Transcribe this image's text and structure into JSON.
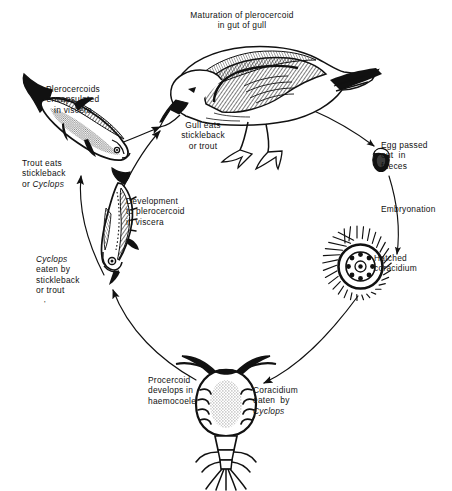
{
  "figure": {
    "kind": "life-cycle-diagram",
    "background_color": "#ffffff",
    "ink_color": "#111111"
  },
  "labels": {
    "title_line1": "Maturation of plerocercoid",
    "title_line2": "in gut of gull",
    "gull_eats_line1": "Gull eats",
    "gull_eats_line2": "stickleback",
    "gull_eats_line3": "or trout",
    "egg_line1": "Egg passed",
    "egg_line2": "out  in",
    "egg_line3": "faeces",
    "embryonation": "Embryonation",
    "hatched_line1": "Hatched",
    "hatched_line2": "coracidium",
    "coracidium_eaten_line1": "Coracidium",
    "coracidium_eaten_line2": "eaten  by",
    "coracidium_eaten_line3": "Cyclops",
    "procercoid_line1": "Procercoid",
    "procercoid_line2": "develops in",
    "procercoid_line3": "haemocoele",
    "cyclops_eaten_line1": "Cyclops",
    "cyclops_eaten_line2": "eaten by",
    "cyclops_eaten_line3": "stickleback",
    "cyclops_eaten_line4": "or trout",
    "development_line1": "Development",
    "development_line2": "to plerocercoid",
    "development_line3": "in viscera",
    "trout_eats_line1": "Trout eats",
    "trout_eats_line2": "stickleback",
    "trout_eats_line3": "or Cyclops",
    "trout_eats_line3_plain": "or ",
    "trout_eats_line3_italic": "Cyclops",
    "plerocercoids_line1": "Plerocercoids",
    "plerocercoids_line2": "encapsulated",
    "plerocercoids_line3": "in viscera",
    "stray_mark": "'"
  },
  "organisms": [
    {
      "name": "gull",
      "label": "Herring gull (definitive host)",
      "position": "top"
    },
    {
      "name": "egg",
      "label": "Tapeworm egg with operculum",
      "position": "right-upper"
    },
    {
      "name": "coracidium",
      "label": "Ciliated coracidium larva",
      "position": "right-lower"
    },
    {
      "name": "cyclops",
      "label": "Cyclops copepod (first intermediate host)",
      "position": "bottom"
    },
    {
      "name": "stickleback",
      "label": "Stickleback (second intermediate host)",
      "position": "left-lower"
    },
    {
      "name": "trout",
      "label": "Trout (paratenic host)",
      "position": "left-upper"
    }
  ],
  "stages": [
    {
      "from": "gull",
      "to": "egg",
      "label": "Egg passed out in faeces"
    },
    {
      "from": "egg",
      "to": "coracidium",
      "label": "Embryonation"
    },
    {
      "from": "coracidium",
      "to": "cyclops",
      "label": "Coracidium eaten by Cyclops"
    },
    {
      "from": "cyclops",
      "to": "stickleback",
      "label": "Cyclops eaten by stickleback or trout"
    },
    {
      "from": "stickleback",
      "to": "trout",
      "label": "Trout eats stickleback or Cyclops"
    },
    {
      "from": "stickleback",
      "to": "gull",
      "label": "Gull eats stickleback or trout"
    },
    {
      "from": "trout",
      "to": "gull",
      "label": "Gull eats stickleback or trout"
    }
  ]
}
